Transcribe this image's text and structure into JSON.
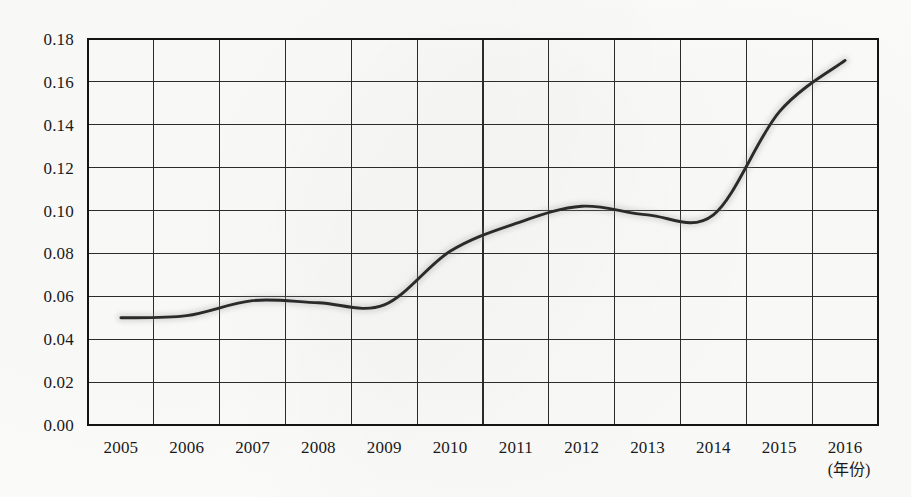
{
  "chart_data": {
    "type": "line",
    "title": "",
    "xlabel": "(年份)",
    "ylabel": "",
    "xlim": [
      2004.5,
      2016.5
    ],
    "ylim": [
      0.0,
      0.18
    ],
    "grid": true,
    "legend": "none",
    "x": [
      2005,
      2006,
      2007,
      2008,
      2009,
      2010,
      2011,
      2012,
      2013,
      2014,
      2015,
      2016
    ],
    "categories": [
      "2005",
      "2006",
      "2007",
      "2008",
      "2009",
      "2010",
      "2011",
      "2012",
      "2013",
      "2014",
      "2015",
      "2016"
    ],
    "values": [
      0.05,
      0.051,
      0.058,
      0.057,
      0.056,
      0.081,
      0.094,
      0.102,
      0.098,
      0.098,
      0.146,
      0.17
    ],
    "y_ticks": [
      0.0,
      0.02,
      0.04,
      0.06,
      0.08,
      0.1,
      0.12,
      0.14,
      0.16,
      0.18
    ],
    "y_tick_labels": [
      "0.00",
      "0.02",
      "0.04",
      "0.06",
      "0.08",
      "0.10",
      "0.12",
      "0.14",
      "0.16",
      "0.18"
    ],
    "x_tick_labels": [
      "2005",
      "2006",
      "2007",
      "2008",
      "2009",
      "2010",
      "2011",
      "2012",
      "2013",
      "2014",
      "2015",
      "2016"
    ],
    "series": [
      {
        "name": "series-1",
        "values": [
          0.05,
          0.051,
          0.058,
          0.057,
          0.056,
          0.081,
          0.094,
          0.102,
          0.098,
          0.098,
          0.146,
          0.17
        ],
        "color": "#2a2a2a"
      }
    ],
    "colors": {
      "line": "#2a2a2a",
      "grid": "#2b2b2b",
      "border": "#141414",
      "background": "#fbfbfa",
      "text": "#1a1a1a"
    }
  },
  "axis": {
    "x_unit_note": "(年份)"
  }
}
